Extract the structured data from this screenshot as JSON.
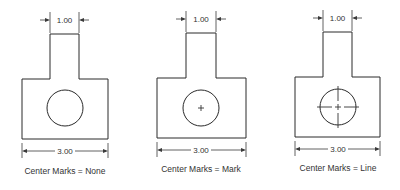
{
  "figures": [
    {
      "id": "none",
      "caption": "Center Marks = None",
      "top_dimension": "1.00",
      "bottom_dimension": "3.00",
      "center_mark_style": "none"
    },
    {
      "id": "mark",
      "caption": "Center Marks = Mark",
      "top_dimension": "1.00",
      "bottom_dimension": "3.00",
      "center_mark_style": "mark"
    },
    {
      "id": "line",
      "caption": "Center Marks = Line",
      "top_dimension": "1.00",
      "bottom_dimension": "3.00",
      "center_mark_style": "line"
    }
  ],
  "colors": {
    "background": "#ffffff",
    "line": "#2a2a2a",
    "text": "#333333"
  }
}
